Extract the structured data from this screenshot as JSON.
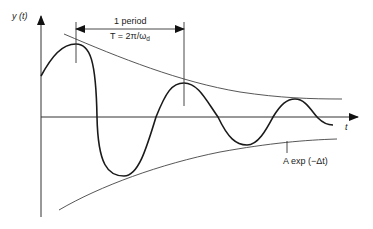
{
  "diagram": {
    "type": "damped-oscillation",
    "y_axis_label": "y (t)",
    "x_axis_label": "t",
    "period_label": "1 period",
    "period_formula": "T = 2π/ω",
    "period_formula_subscript": "d",
    "envelope_label": "A exp (−Δt)",
    "colors": {
      "curve": "#1a1a1a",
      "axes": "#333333",
      "envelope": "#444444",
      "background": "#ffffff"
    }
  }
}
